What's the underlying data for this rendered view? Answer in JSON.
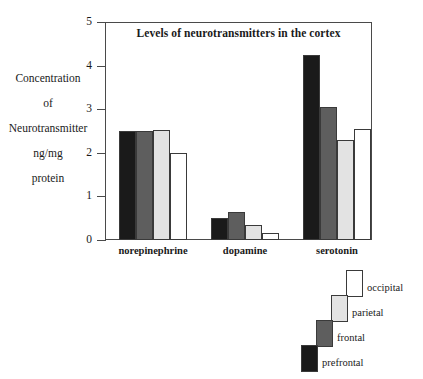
{
  "chart_data": {
    "type": "bar",
    "title": "Levels of neurotransmitters in the cortex",
    "xlabel": "",
    "ylabel": "Concentration of Neurotransmitter ng/mg protein",
    "ylabel_lines": [
      "Concentration",
      "of",
      "Neurotransmitter",
      "ng/mg",
      "protein"
    ],
    "categories": [
      "norepinephrine",
      "dopamine",
      "serotonin"
    ],
    "ylim": [
      0,
      5
    ],
    "yticks": [
      0,
      1,
      2,
      3,
      4,
      5
    ],
    "ytick_labels": [
      "0",
      "1",
      "2",
      "3",
      "4",
      "5"
    ],
    "grid": false,
    "legend_position": "below-right",
    "series": [
      {
        "name": "prefrontal",
        "color": "#1a1a1a",
        "values": [
          2.5,
          0.5,
          4.25
        ]
      },
      {
        "name": "frontal",
        "color": "#5e5e5e",
        "values": [
          2.5,
          0.65,
          3.05
        ]
      },
      {
        "name": "parietal",
        "color": "#e3e3e3",
        "values": [
          2.52,
          0.35,
          2.3
        ]
      },
      {
        "name": "occipital",
        "color": "#ffffff",
        "values": [
          2.0,
          0.15,
          2.55
        ]
      }
    ]
  },
  "legend": {
    "items": [
      {
        "label": "occipital",
        "color": "#ffffff"
      },
      {
        "label": "parietal",
        "color": "#e3e3e3"
      },
      {
        "label": "frontal",
        "color": "#5e5e5e"
      },
      {
        "label": "prefrontal",
        "color": "#1a1a1a"
      }
    ]
  }
}
